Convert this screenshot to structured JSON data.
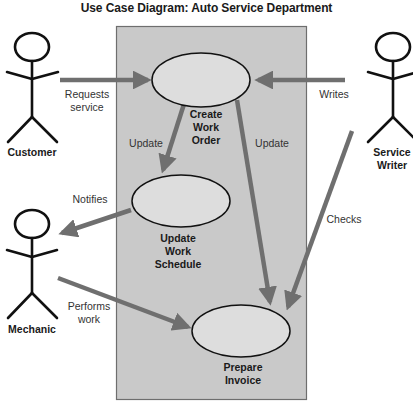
{
  "title": "Use Case Diagram: Auto Service Department",
  "colors": {
    "system_box_fill": "#c9c9c9",
    "system_box_border": "#6e6e6e",
    "use_case_fill": "#dddddd",
    "use_case_stroke": "#111111",
    "arrow": "#6f6f6f",
    "actor_stroke": "#111111"
  },
  "actors": [
    {
      "id": "customer",
      "label": "Customer"
    },
    {
      "id": "service_writer",
      "label": "Service Writer",
      "lines": [
        "Service",
        "Writer"
      ]
    },
    {
      "id": "mechanic",
      "label": "Mechanic"
    }
  ],
  "use_cases": [
    {
      "id": "create_work_order",
      "label": "Create Work Order",
      "lines": [
        "Create",
        "Work",
        "Order"
      ]
    },
    {
      "id": "update_work_schedule",
      "label": "Update Work Schedule",
      "lines": [
        "Update",
        "Work",
        "Schedule"
      ]
    },
    {
      "id": "prepare_invoice",
      "label": "Prepare Invoice",
      "lines": [
        "Prepare",
        "Invoice"
      ]
    }
  ],
  "relationships": [
    {
      "from": "customer",
      "to": "create_work_order",
      "label": "Requests service",
      "lines": [
        "Requests",
        "service"
      ]
    },
    {
      "from": "service_writer",
      "to": "create_work_order",
      "label": "Writes"
    },
    {
      "from": "create_work_order",
      "to": "update_work_schedule",
      "label": "Update"
    },
    {
      "from": "create_work_order",
      "to": "prepare_invoice",
      "label": "Update"
    },
    {
      "from": "update_work_schedule",
      "to": "mechanic",
      "label": "Notifies"
    },
    {
      "from": "service_writer",
      "to": "prepare_invoice",
      "label": "Checks"
    },
    {
      "from": "mechanic",
      "to": "prepare_invoice",
      "label": "Performs work",
      "lines": [
        "Performs",
        "work"
      ]
    }
  ]
}
